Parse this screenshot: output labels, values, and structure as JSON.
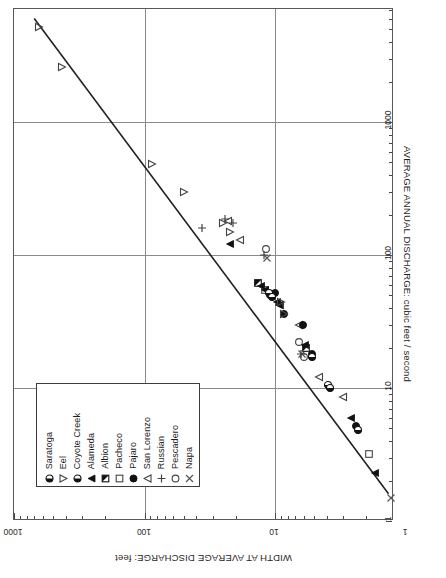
{
  "chart_data": {
    "type": "scatter",
    "title": "",
    "orientation": "rotated-180",
    "xlabel": "AVERAGE ANNUAL DISCHARGE:  cubic feet / second",
    "ylabel": "WIDTH AT AVERAGE DISCHARGE:  feet",
    "xscale": "log",
    "yscale": "log",
    "xlim": [
      1,
      10000
    ],
    "ylim": [
      1,
      1000
    ],
    "xticks": [
      1,
      10,
      100,
      1000
    ],
    "xtick_labels": [
      "1",
      "10",
      "100",
      "1000"
    ],
    "yticks": [
      1,
      10,
      100,
      1000
    ],
    "ytick_labels": [
      "1",
      "10",
      "100",
      "1000"
    ],
    "grid": true,
    "legend_position": "lower-left",
    "trend_line": {
      "label": "",
      "x_start": 1.6,
      "y_start": 1.35,
      "x_end": 6000,
      "y_end": 700
    },
    "series": [
      {
        "name": "Napa",
        "marker": "x",
        "points": [
          [
            1.5,
            1.3
          ],
          [
            95,
            11.5
          ],
          [
            18,
            6.2
          ]
        ]
      },
      {
        "name": "Pescadero",
        "marker": "circle-open",
        "points": [
          [
            22,
            6.6
          ],
          [
            17,
            6.0
          ],
          [
            110,
            11.8
          ]
        ]
      },
      {
        "name": "Russian",
        "marker": "plus",
        "points": [
          [
            160,
            36
          ],
          [
            175,
            21
          ],
          [
            185,
            24
          ],
          [
            100,
            12.2
          ],
          [
            18,
            6.3
          ]
        ]
      },
      {
        "name": "San Lorenzo",
        "marker": "triangle-left-open",
        "points": [
          [
            130,
            18.5
          ],
          [
            180,
            23
          ],
          [
            12,
            4.6
          ],
          [
            8.5,
            3.0
          ],
          [
            42,
            9.2
          ],
          [
            30,
            6.6
          ]
        ]
      },
      {
        "name": "Pajaro",
        "marker": "circle-filled",
        "points": [
          [
            50,
            11.0
          ],
          [
            36,
            8.5
          ],
          [
            18,
            5.2
          ],
          [
            30,
            6.1
          ],
          [
            5.2,
            2.4
          ],
          [
            52,
            10.0
          ]
        ]
      },
      {
        "name": "Pacheco",
        "marker": "square-open",
        "points": [
          [
            55,
            12.0
          ],
          [
            3.2,
            1.9
          ]
        ]
      },
      {
        "name": "Albion",
        "marker": "square-half",
        "points": [
          [
            62,
            13.5
          ],
          [
            20,
            5.8
          ]
        ]
      },
      {
        "name": "Alameda",
        "marker": "triangle-left-filled",
        "points": [
          [
            120,
            22
          ],
          [
            58,
            12.8
          ],
          [
            55,
            12.0
          ],
          [
            44,
            9.6
          ],
          [
            42,
            9.4
          ],
          [
            21,
            5.9
          ],
          [
            6.0,
            2.6
          ],
          [
            2.3,
            1.7
          ]
        ]
      },
      {
        "name": "Coyote Creek",
        "marker": "circle-half",
        "points": [
          [
            52,
            11.2
          ],
          [
            48,
            10.6
          ],
          [
            10.5,
            3.9
          ],
          [
            4.8,
            2.3
          ]
        ]
      },
      {
        "name": "Eel",
        "marker": "triangle-right-open",
        "points": [
          [
            5200,
            640
          ],
          [
            2600,
            430
          ],
          [
            480,
            88
          ],
          [
            300,
            50
          ],
          [
            175,
            25
          ],
          [
            150,
            22
          ],
          [
            44,
            9.0
          ],
          [
            36,
            8.6
          ]
        ]
      },
      {
        "name": "Saratoga",
        "marker": "circle-half",
        "points": [
          [
            17,
            5.2
          ],
          [
            10.0,
            3.8
          ]
        ]
      }
    ]
  },
  "axes": {
    "x_title": "AVERAGE ANNUAL DISCHARGE:  cubic feet / second",
    "y_title": "WIDTH AT AVERAGE DISCHARGE:  feet",
    "x_tick_labels": [
      "1",
      "10",
      "100",
      "1000"
    ],
    "y_tick_labels": [
      "1000",
      "100",
      "10",
      "1"
    ]
  },
  "legend": {
    "title": "",
    "entries": [
      {
        "label": "Napa",
        "marker": "x"
      },
      {
        "label": "Pescadero",
        "marker": "circle-open"
      },
      {
        "label": "Russian",
        "marker": "plus"
      },
      {
        "label": "San Lorenzo",
        "marker": "triangle-left-open"
      },
      {
        "label": "Pajaro",
        "marker": "circle-filled"
      },
      {
        "label": "Pacheco",
        "marker": "square-open"
      },
      {
        "label": "Albion",
        "marker": "square-half"
      },
      {
        "label": "Alameda",
        "marker": "triangle-left-filled"
      },
      {
        "label": "Coyote Creek",
        "marker": "circle-half"
      },
      {
        "label": "Eel",
        "marker": "triangle-right-open"
      },
      {
        "label": "Saratoga",
        "marker": "circle-half"
      }
    ]
  },
  "colors": {
    "ink": "#1a1a1a",
    "grid": "#8a8a8a",
    "frame": "#595959",
    "background": "#ffffff"
  }
}
